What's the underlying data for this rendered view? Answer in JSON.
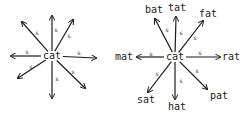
{
  "diagrams": [
    {
      "name": "left-cat-graph",
      "center": {
        "label": "cat",
        "x": 52,
        "y": 56
      },
      "edge_label": "s",
      "edges": [
        {
          "dir": "up-left",
          "x": 22,
          "y": 22,
          "s_x": 37,
          "s_y": 33,
          "target": ""
        },
        {
          "dir": "up",
          "x": 52,
          "y": 16,
          "s_x": 56,
          "s_y": 30,
          "target": ""
        },
        {
          "dir": "up-right",
          "x": 73,
          "y": 20,
          "s_x": 69,
          "s_y": 36,
          "target": ""
        },
        {
          "dir": "left",
          "x": 11,
          "y": 56,
          "s_x": 27,
          "s_y": 52,
          "target": ""
        },
        {
          "dir": "right",
          "x": 96,
          "y": 58,
          "s_x": 79,
          "s_y": 53,
          "target": ""
        },
        {
          "dir": "down-left",
          "x": 18,
          "y": 78,
          "s_x": 31,
          "s_y": 67,
          "target": ""
        },
        {
          "dir": "down",
          "x": 52,
          "y": 98,
          "s_x": 57,
          "s_y": 79,
          "target": ""
        },
        {
          "dir": "down-right",
          "x": 85,
          "y": 88,
          "s_x": 73,
          "s_y": 72,
          "target": ""
        }
      ]
    },
    {
      "name": "right-cat-graph",
      "center": {
        "label": "cat",
        "x": 175,
        "y": 57
      },
      "edge_label": "s",
      "edges": [
        {
          "dir": "up-left",
          "x": 155,
          "y": 19,
          "s_x": 167,
          "s_y": 30,
          "target": "bat",
          "t_x": 154,
          "t_y": 10
        },
        {
          "dir": "up",
          "x": 176,
          "y": 17,
          "s_x": 181,
          "s_y": 33,
          "target": "tat",
          "t_x": 177,
          "t_y": 8
        },
        {
          "dir": "up-right",
          "x": 203,
          "y": 21,
          "s_x": 195,
          "s_y": 38,
          "target": "fat",
          "t_x": 208,
          "t_y": 14
        },
        {
          "dir": "left",
          "x": 137,
          "y": 57,
          "s_x": 151,
          "s_y": 54,
          "target": "mat",
          "t_x": 124,
          "t_y": 57
        },
        {
          "dir": "right",
          "x": 220,
          "y": 57,
          "s_x": 200,
          "s_y": 53,
          "target": "rat",
          "t_x": 231,
          "t_y": 57
        },
        {
          "dir": "down-left",
          "x": 148,
          "y": 92,
          "s_x": 157,
          "s_y": 74,
          "target": "sat",
          "t_x": 146,
          "t_y": 100
        },
        {
          "dir": "down",
          "x": 175,
          "y": 99,
          "s_x": 181,
          "s_y": 81,
          "target": "hat",
          "t_x": 177,
          "t_y": 107
        },
        {
          "dir": "down-right",
          "x": 207,
          "y": 89,
          "s_x": 197,
          "s_y": 71,
          "target": "pat",
          "t_x": 219,
          "t_y": 96
        }
      ]
    }
  ],
  "colors": {
    "ink": "#1a1a1a",
    "background": "#ffffff"
  }
}
